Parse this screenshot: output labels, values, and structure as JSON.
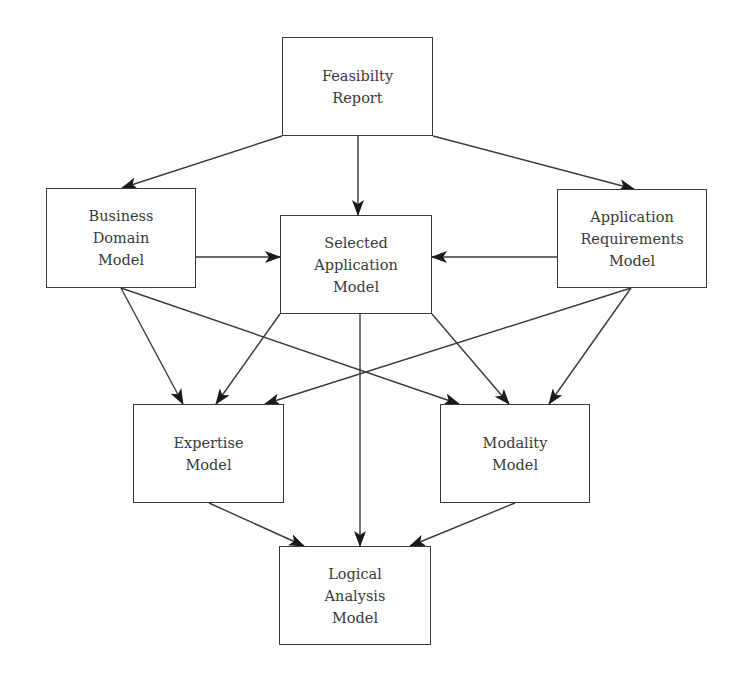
{
  "diagram": {
    "type": "flowchart",
    "colors": {
      "background": "#ffffff",
      "stroke": "#3a3a3a",
      "text": "#3a3a3a"
    },
    "nodes": [
      {
        "id": "feasibility",
        "lines": [
          "Feasibilty",
          "Report"
        ],
        "x": 282,
        "y": 37,
        "w": 151,
        "h": 99
      },
      {
        "id": "business",
        "lines": [
          "Business",
          "Domain",
          "Model"
        ],
        "x": 46,
        "y": 188,
        "w": 150,
        "h": 100
      },
      {
        "id": "selected",
        "lines": [
          "Selected",
          "Application",
          "Model"
        ],
        "x": 280,
        "y": 215,
        "w": 152,
        "h": 99
      },
      {
        "id": "requirements",
        "lines": [
          "Application",
          "Requirements",
          "Model"
        ],
        "x": 557,
        "y": 189,
        "w": 150,
        "h": 99
      },
      {
        "id": "expertise",
        "lines": [
          "Expertise",
          "Model"
        ],
        "x": 133,
        "y": 404,
        "w": 151,
        "h": 99
      },
      {
        "id": "modality",
        "lines": [
          "Modality",
          "Model"
        ],
        "x": 440,
        "y": 404,
        "w": 150,
        "h": 99
      },
      {
        "id": "logical",
        "lines": [
          "Logical",
          "Analysis",
          "Model"
        ],
        "x": 279,
        "y": 546,
        "w": 152,
        "h": 99
      }
    ],
    "edges": [
      {
        "from": "feasibility",
        "to": "business",
        "x1": 282,
        "y1": 136,
        "x2": 122,
        "y2": 188
      },
      {
        "from": "feasibility",
        "to": "selected",
        "x1": 358,
        "y1": 136,
        "x2": 358,
        "y2": 215
      },
      {
        "from": "feasibility",
        "to": "requirements",
        "x1": 433,
        "y1": 136,
        "x2": 634,
        "y2": 189
      },
      {
        "from": "business",
        "to": "selected",
        "x1": 196,
        "y1": 257,
        "x2": 280,
        "y2": 257
      },
      {
        "from": "requirements",
        "to": "selected",
        "x1": 557,
        "y1": 257,
        "x2": 432,
        "y2": 257
      },
      {
        "from": "business",
        "to": "expertise",
        "x1": 121,
        "y1": 288,
        "x2": 183,
        "y2": 404
      },
      {
        "from": "business",
        "to": "modality",
        "x1": 121,
        "y1": 288,
        "x2": 459,
        "y2": 404
      },
      {
        "from": "selected",
        "to": "expertise",
        "x1": 280,
        "y1": 314,
        "x2": 216,
        "y2": 404
      },
      {
        "from": "selected",
        "to": "modality",
        "x1": 432,
        "y1": 314,
        "x2": 509,
        "y2": 404
      },
      {
        "from": "selected",
        "to": "logical",
        "x1": 360,
        "y1": 314,
        "x2": 360,
        "y2": 546
      },
      {
        "from": "requirements",
        "to": "expertise",
        "x1": 631,
        "y1": 288,
        "x2": 265,
        "y2": 404
      },
      {
        "from": "requirements",
        "to": "modality",
        "x1": 631,
        "y1": 288,
        "x2": 549,
        "y2": 404
      },
      {
        "from": "expertise",
        "to": "logical",
        "x1": 209,
        "y1": 503,
        "x2": 304,
        "y2": 546
      },
      {
        "from": "modality",
        "to": "logical",
        "x1": 515,
        "y1": 503,
        "x2": 410,
        "y2": 546
      }
    ]
  }
}
